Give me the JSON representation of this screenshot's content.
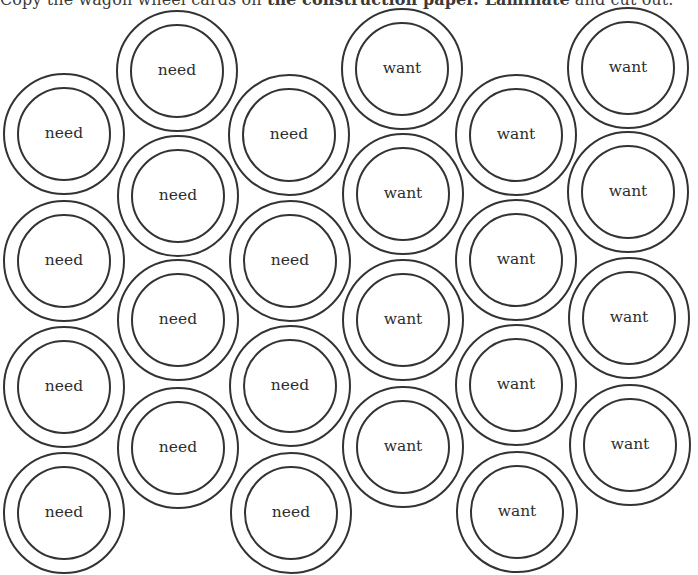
{
  "instructions": {
    "part1": "Copy the wagon wheel cards on ",
    "part2": "the construction paper. Laminate",
    "part3": " and cut out."
  },
  "cards": {
    "need": "need",
    "want": "want",
    "columns": [
      {
        "label": "need",
        "items": [
          "need",
          "need",
          "need",
          "need"
        ]
      },
      {
        "label": "need",
        "items": [
          "need",
          "need",
          "need",
          "need"
        ]
      },
      {
        "label": "need",
        "items": [
          "need",
          "need",
          "need",
          "need"
        ]
      },
      {
        "label": "want",
        "items": [
          "want",
          "want",
          "want",
          "want"
        ]
      },
      {
        "label": "want",
        "items": [
          "want",
          "want",
          "want",
          "want"
        ]
      },
      {
        "label": "want",
        "items": [
          "want",
          "want",
          "want",
          "want"
        ]
      }
    ]
  }
}
